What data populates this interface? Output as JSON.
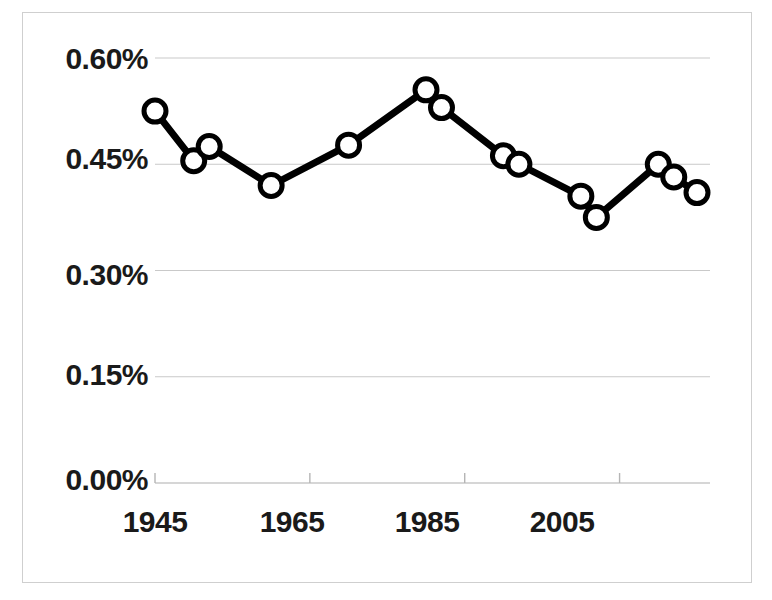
{
  "chart_data": {
    "type": "line",
    "title": "",
    "subtitle": "",
    "xlabel": "",
    "ylabel": "",
    "xlim": [
      1945,
      2015
    ],
    "ylim": [
      0.0,
      0.6
    ],
    "grid": true,
    "legend": false,
    "legend_position": "none",
    "y_tick_labels": [
      "0.60%",
      "0.45%",
      "0.30%",
      "0.15%",
      "0.00%"
    ],
    "y_tick_values": [
      0.6,
      0.45,
      0.3,
      0.15,
      0.0
    ],
    "x_tick_labels": [
      "1945",
      "1965",
      "1985",
      "2005"
    ],
    "x_tick_values": [
      1945,
      1965,
      1985,
      2005
    ],
    "value_unit": "%",
    "marker": "open-circle",
    "line_color": "#000000",
    "marker_fill": "#ffffff",
    "marker_stroke": "#000000",
    "grid_color": "#c9c9c9",
    "axis_color": "#b5b5b5",
    "x": [
      1945,
      1950,
      1952,
      1960,
      1970,
      1980,
      1982,
      1990,
      1992,
      2000,
      2002,
      2010,
      2012,
      2015
    ],
    "values": [
      0.525,
      0.455,
      0.475,
      0.42,
      0.477,
      0.555,
      0.53,
      0.462,
      0.45,
      0.405,
      0.375,
      0.45,
      0.432,
      0.41
    ],
    "series": [
      {
        "name": "series-1",
        "points": [
          {
            "x": 1945,
            "y": 0.525
          },
          {
            "x": 1950,
            "y": 0.455
          },
          {
            "x": 1952,
            "y": 0.475
          },
          {
            "x": 1960,
            "y": 0.42
          },
          {
            "x": 1970,
            "y": 0.477
          },
          {
            "x": 1980,
            "y": 0.555
          },
          {
            "x": 1982,
            "y": 0.53
          },
          {
            "x": 1990,
            "y": 0.462
          },
          {
            "x": 1992,
            "y": 0.45
          },
          {
            "x": 2000,
            "y": 0.405
          },
          {
            "x": 2002,
            "y": 0.375
          },
          {
            "x": 2010,
            "y": 0.45
          },
          {
            "x": 2012,
            "y": 0.432
          },
          {
            "x": 2015,
            "y": 0.41
          }
        ]
      }
    ]
  },
  "axes": {
    "y_labels": [
      {
        "text": "0.60%",
        "top": 42
      },
      {
        "text": "0.45%",
        "top": 142
      },
      {
        "text": "0.30%",
        "top": 258
      },
      {
        "text": "0.15%",
        "top": 358
      },
      {
        "text": "0.00%",
        "top": 463
      }
    ],
    "x_labels": [
      {
        "text": "1945",
        "left": 95
      },
      {
        "text": "1965",
        "left": 232
      },
      {
        "text": "1985",
        "left": 367
      },
      {
        "text": "2005",
        "left": 502
      }
    ]
  }
}
